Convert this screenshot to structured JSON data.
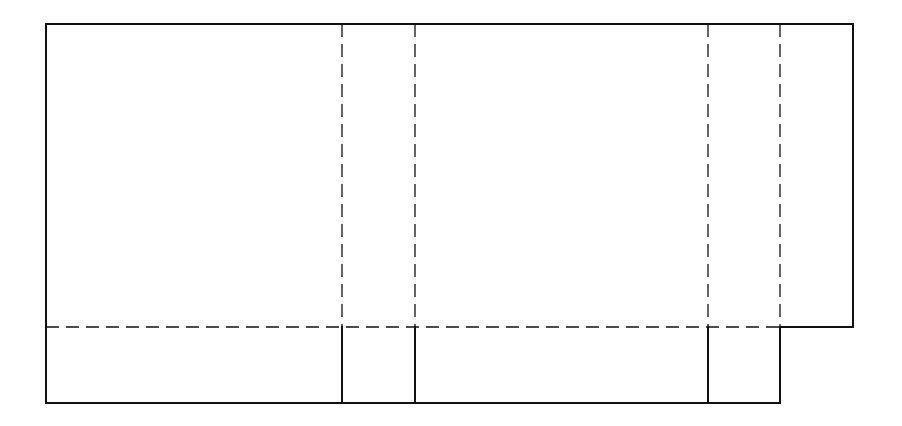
{
  "diagram": {
    "type": "box-net",
    "colors": {
      "background": "#ffffff",
      "line": "#111111"
    },
    "line_styles": {
      "cut": "solid",
      "fold": "dashed"
    },
    "panels": [
      {
        "name": "panel-1",
        "x_start": 46,
        "x_end": 342
      },
      {
        "name": "panel-2",
        "x_start": 342,
        "x_end": 415
      },
      {
        "name": "panel-3",
        "x_start": 415,
        "x_end": 708
      },
      {
        "name": "panel-4",
        "x_start": 708,
        "x_end": 780
      },
      {
        "name": "glue-flap",
        "x_start": 780,
        "x_end": 853
      }
    ],
    "fold_lines": {
      "vertical_x": [
        342,
        415,
        708,
        780
      ],
      "horizontal_y": 327
    },
    "bounds": {
      "top": 24,
      "bottom": 403,
      "left": 46,
      "right": 853,
      "flap_bottom": 327
    }
  }
}
